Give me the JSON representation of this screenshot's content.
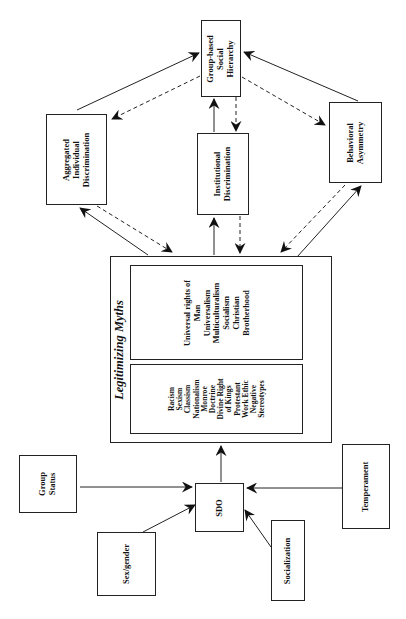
{
  "diagram": {
    "nodes": {
      "group_hierarchy": {
        "lines": [
          "Group-based",
          "Social",
          "Hierarchy"
        ]
      },
      "aggregated": {
        "lines": [
          "Aggregated",
          "Individual",
          "Discrimination"
        ]
      },
      "institutional": {
        "lines": [
          "Institutional",
          "Discrimination"
        ]
      },
      "behavioral": {
        "lines": [
          "Behavioral",
          "Asymmetry"
        ]
      },
      "myths": {
        "title": "Legitimizing Myths",
        "enhancing": [
          "Racism",
          "Sexism",
          "Classism",
          "Nationalism",
          "Monroe",
          "Doctrine",
          "Divine Right",
          "of Kings",
          "Protestant",
          "Work Ethic",
          "Negative",
          "Stereotypes"
        ],
        "attenuating": [
          "Universal rights of",
          "Man",
          "Universalism",
          "Multiculturalism",
          "Socialism",
          "Christian",
          "Brotherhood"
        ]
      },
      "sdo": {
        "lines": [
          "SDO"
        ]
      },
      "group_status": {
        "lines": [
          "Group",
          "Status"
        ]
      },
      "temperament": {
        "lines": [
          "Temperament"
        ]
      },
      "sex_gender": {
        "lines": [
          "Sex/gender"
        ]
      },
      "socialization": {
        "lines": [
          "Socialization"
        ]
      }
    },
    "edges": [
      {
        "from": "Aggregated Individual Discrimination",
        "to": "Group-based Social Hierarchy",
        "style": "solid"
      },
      {
        "from": "Group-based Social Hierarchy",
        "to": "Aggregated Individual Discrimination",
        "style": "dashed"
      },
      {
        "from": "Institutional Discrimination",
        "to": "Group-based Social Hierarchy",
        "style": "solid"
      },
      {
        "from": "Group-based Social Hierarchy",
        "to": "Institutional Discrimination",
        "style": "dashed"
      },
      {
        "from": "Behavioral Asymmetry",
        "to": "Group-based Social Hierarchy",
        "style": "solid"
      },
      {
        "from": "Group-based Social Hierarchy",
        "to": "Behavioral Asymmetry",
        "style": "dashed"
      },
      {
        "from": "Legitimizing Myths",
        "to": "Aggregated Individual Discrimination",
        "style": "solid"
      },
      {
        "from": "Aggregated Individual Discrimination",
        "to": "Legitimizing Myths",
        "style": "dashed"
      },
      {
        "from": "Legitimizing Myths",
        "to": "Institutional Discrimination",
        "style": "solid"
      },
      {
        "from": "Institutional Discrimination",
        "to": "Legitimizing Myths",
        "style": "dashed"
      },
      {
        "from": "Legitimizing Myths",
        "to": "Behavioral Asymmetry",
        "style": "solid"
      },
      {
        "from": "Behavioral Asymmetry",
        "to": "Legitimizing Myths",
        "style": "dashed"
      },
      {
        "from": "SDO",
        "to": "Legitimizing Myths",
        "style": "solid"
      },
      {
        "from": "Group Status",
        "to": "SDO",
        "style": "solid"
      },
      {
        "from": "Temperament",
        "to": "SDO",
        "style": "solid"
      },
      {
        "from": "Sex/gender",
        "to": "SDO",
        "style": "solid"
      },
      {
        "from": "Socialization",
        "to": "SDO",
        "style": "solid"
      }
    ],
    "colors": {
      "line": "#222222",
      "background": "#ffffff"
    }
  }
}
